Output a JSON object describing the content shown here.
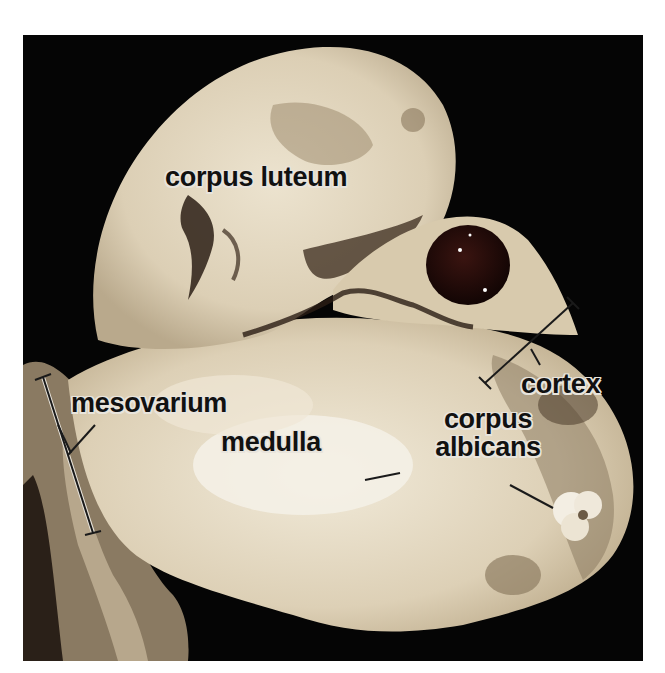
{
  "figure": {
    "background_color": "#050505",
    "tissue_color": "#e2d6bf",
    "labels": {
      "corpus_luteum": "corpus luteum",
      "mesovarium": "mesovarium",
      "medulla": "medulla",
      "corpus_albicans_line1": "corpus",
      "corpus_albicans_line2": "albicans",
      "cortex": "cortex"
    }
  }
}
